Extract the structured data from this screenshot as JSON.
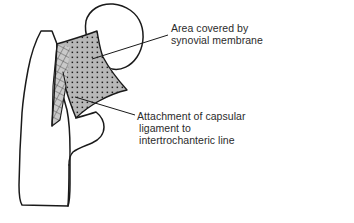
{
  "figure": {
    "background_color": "#ffffff",
    "outline_color": "#1a1a1a",
    "stipple_fill_color": "#b8b8b8",
    "stipple_dot_color": "#1f1f1f",
    "hatch_fill_color": "#c4c4c4",
    "hatch_line_color": "#3a3a3a",
    "leader_line_color": "#1a1a1a",
    "text_color": "#2b2b2b"
  },
  "bone": {
    "name": "femur",
    "parts": [
      {
        "name": "head-of-femur",
        "label": "head of femur"
      },
      {
        "name": "neck-of-femur",
        "label": "neck of femur"
      },
      {
        "name": "greater-trochanter",
        "label": "greater trochanter"
      },
      {
        "name": "lesser-trochanter",
        "label": "lesser trochanter"
      },
      {
        "name": "femoral-shaft",
        "label": "shaft of femur"
      }
    ]
  },
  "regions": {
    "synovial_area": {
      "name": "synovial-membrane-area",
      "pattern": "stipple-dots-on-grey"
    },
    "capsular_attachment": {
      "name": "intertrochanteric-line-band",
      "pattern": "diagonal-cross-hatch"
    }
  },
  "labels": [
    {
      "id": "synovial",
      "lines": [
        "Area covered by",
        "synovial membrane"
      ],
      "leader": {
        "from_x": 92,
        "from_y": 59,
        "to_x": 168,
        "to_y": 35
      }
    },
    {
      "id": "capsular",
      "lines": [
        "Attachment of capsular",
        "ligament to",
        "intertrochanteric line"
      ],
      "leader": {
        "from_x": 75,
        "from_y": 97,
        "to_x": 135,
        "to_y": 115
      }
    }
  ]
}
